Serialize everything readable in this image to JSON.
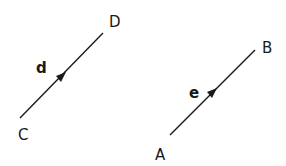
{
  "diagram": {
    "vectors": [
      {
        "name": "d",
        "from": "C",
        "to": "D",
        "start": [
          20,
          118
        ],
        "end": [
          103,
          33
        ],
        "arrow": [
          62,
          76
        ]
      },
      {
        "name": "e",
        "from": "A",
        "to": "B",
        "start": [
          170,
          135
        ],
        "end": [
          255,
          50
        ],
        "arrow": [
          213,
          92
        ]
      }
    ],
    "points": {
      "C": "C",
      "D": "D",
      "A": "A",
      "B": "B"
    },
    "labels": {
      "d": "d",
      "e": "e"
    },
    "color": "#1a1a1a"
  }
}
